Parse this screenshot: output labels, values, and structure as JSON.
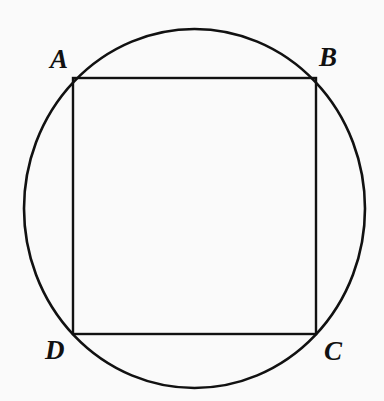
{
  "figure": {
    "background_color": "#fafafa",
    "stroke_color": "#111111",
    "canvas": {
      "width": 384,
      "height": 401
    },
    "labels": {
      "a": "A",
      "b": "B",
      "c": "C",
      "d": "D"
    },
    "shapes": {
      "circle": {
        "name": "circumscribed-circle",
        "center_x": 194.5,
        "center_y": 208.5,
        "radius_x": 170.5,
        "radius_y": 179.5,
        "stroke_width": 2.6,
        "fill": "none"
      },
      "square": {
        "name": "inscribed-square",
        "left": 73,
        "top": 78,
        "right": 316,
        "bottom": 334,
        "width": 243,
        "height": 256,
        "stroke_width": 2.4,
        "fill": "none"
      }
    },
    "vertices": [
      {
        "label": "A",
        "x": 73,
        "y": 78,
        "position": "top-left"
      },
      {
        "label": "B",
        "x": 316,
        "y": 78,
        "position": "top-right"
      },
      {
        "label": "C",
        "x": 316,
        "y": 334,
        "position": "bottom-right"
      },
      {
        "label": "D",
        "x": 73,
        "y": 334,
        "position": "bottom-left"
      }
    ]
  }
}
